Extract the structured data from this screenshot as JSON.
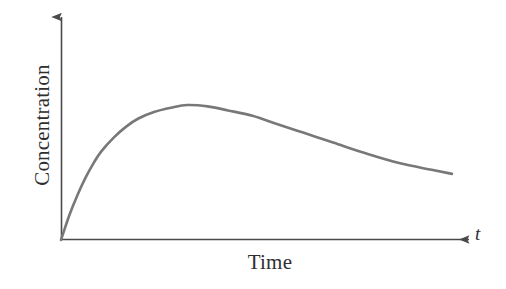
{
  "figure": {
    "background_color": "#ffffff",
    "curve_color": "#787878",
    "axis_color": "#4a4a4a",
    "text_color": "#2e2e2e"
  },
  "labels": {
    "y_axis_title": "Concentration",
    "x_axis_title": "Time",
    "x_axis_symbol": "t"
  },
  "chart_data": {
    "type": "line",
    "title": "",
    "subtitle": "",
    "xlabel": "Time",
    "ylabel": "Concentration",
    "x_axis_symbol": "t",
    "grid": false,
    "legend": null,
    "legend_position": "none",
    "axis_ticks": {
      "x": [],
      "y": []
    },
    "xlim": [
      0,
      1
    ],
    "ylim": [
      0,
      1
    ],
    "annotations": [],
    "series": [
      {
        "name": "Plasma drug concentration",
        "color": "#787878",
        "line_width": 2.6,
        "description": "Single oral-dose pharmacokinetic curve: rapid absorption to a peak concentration (Cmax) followed by a slow first-order elimination decay.",
        "x": [
          0.0,
          0.02,
          0.04,
          0.06,
          0.08,
          0.1,
          0.13,
          0.16,
          0.19,
          0.23,
          0.27,
          0.31,
          0.36,
          0.41,
          0.47,
          0.53,
          0.6,
          0.67,
          0.75,
          0.83,
          0.91,
          0.96
        ],
        "y": [
          0.0,
          0.18,
          0.33,
          0.46,
          0.57,
          0.66,
          0.76,
          0.84,
          0.9,
          0.95,
          0.98,
          1.0,
          0.99,
          0.96,
          0.92,
          0.86,
          0.79,
          0.72,
          0.64,
          0.57,
          0.52,
          0.49
        ]
      }
    ],
    "features": {
      "peak_x": 0.31,
      "peak_y": 1.0,
      "start_x": 0.0,
      "start_y": 0.0,
      "end_x": 0.96,
      "end_y": 0.49
    }
  },
  "geometry": {
    "origin": {
      "x": 61,
      "y": 240
    },
    "y_axis_top": {
      "x": 61,
      "y": 16
    },
    "x_axis_right": {
      "x": 470,
      "y": 240
    },
    "curve_peak": {
      "x": 155,
      "y": 105
    },
    "curve_end": {
      "x": 452,
      "y": 174
    }
  }
}
